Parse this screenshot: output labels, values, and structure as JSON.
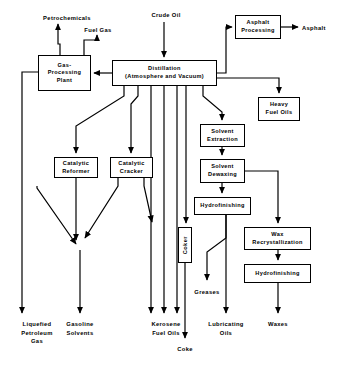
{
  "diagram": {
    "colors": {
      "line": "#000000",
      "box_fill": "#ffffff",
      "background": "#ffffff"
    },
    "process_boxes": [
      {
        "id": "gas-processing-plant",
        "label": "Gas-\nProcessing\nPlant",
        "x": 38,
        "y": 55,
        "w": 53,
        "h": 36
      },
      {
        "id": "distillation",
        "label": "Distillation\n(Atmosphere and Vacuum)",
        "x": 112,
        "y": 60,
        "w": 105,
        "h": 26
      },
      {
        "id": "asphalt-processing",
        "label": "Asphalt\nProcessing",
        "x": 235,
        "y": 15,
        "w": 46,
        "h": 24
      },
      {
        "id": "heavy-fuel-oils",
        "label": "Heavy\nFuel Oils",
        "x": 258,
        "y": 97,
        "w": 42,
        "h": 24
      },
      {
        "id": "catalytic-reformer",
        "label": "Catalytic\nReformer",
        "x": 54,
        "y": 157,
        "w": 44,
        "h": 21
      },
      {
        "id": "catalytic-cracker",
        "label": "Catalytic\nCracker",
        "x": 110,
        "y": 157,
        "w": 43,
        "h": 21
      },
      {
        "id": "solvent-extraction",
        "label": "Solvent\nExtraction",
        "x": 200,
        "y": 124,
        "w": 45,
        "h": 23
      },
      {
        "id": "solvent-dewaxing",
        "label": "Solvent\nDewaxing",
        "x": 200,
        "y": 159,
        "w": 45,
        "h": 24
      },
      {
        "id": "hydrofinishing-lube",
        "label": "Hydrofinishing",
        "x": 194,
        "y": 197,
        "w": 57,
        "h": 18
      },
      {
        "id": "wax-recrystallization",
        "label": "Wax\nRecrystallization",
        "x": 244,
        "y": 227,
        "w": 67,
        "h": 23
      },
      {
        "id": "hydrofinishing-wax",
        "label": "Hydrofinishing",
        "x": 244,
        "y": 264,
        "w": 67,
        "h": 19
      }
    ],
    "vertical_boxes": [
      {
        "id": "coker",
        "label": "Coker",
        "x": 178,
        "y": 227,
        "w": 14,
        "h": 36
      }
    ],
    "stream_labels": [
      {
        "id": "petrochemicals",
        "text": "Petrochemicals",
        "x": 31,
        "y": 14,
        "w": 72
      },
      {
        "id": "fuel-gas",
        "text": "Fuel Gas",
        "x": 74,
        "y": 26,
        "w": 48
      },
      {
        "id": "crude-oil",
        "text": "Crude Oil",
        "x": 140,
        "y": 11,
        "w": 52
      },
      {
        "id": "asphalt",
        "text": "Asphalt",
        "x": 302,
        "y": 24,
        "w": 40
      },
      {
        "id": "greases",
        "text": "Greases",
        "x": 186,
        "y": 288,
        "w": 42
      },
      {
        "id": "liquefied-petroleum-gas",
        "text": "Liquefied\nPetroleum\nGas",
        "x": 9,
        "y": 320,
        "w": 56
      },
      {
        "id": "gasoline-solvents",
        "text": "Gasoline\nSolvents",
        "x": 54,
        "y": 320,
        "w": 52
      },
      {
        "id": "kerosene-fuel-oils",
        "text": "Kerosene\nFuel Oils",
        "x": 140,
        "y": 320,
        "w": 52
      },
      {
        "id": "coke",
        "text": "Coke",
        "x": 167,
        "y": 345,
        "w": 36
      },
      {
        "id": "lubricating-oils",
        "text": "Lubricating\nOils",
        "x": 197,
        "y": 320,
        "w": 58
      },
      {
        "id": "waxes",
        "text": "Waxes",
        "x": 258,
        "y": 320,
        "w": 40
      }
    ],
    "connections": [
      {
        "from": "crude-oil",
        "to": "distillation"
      },
      {
        "from": "distillation",
        "to": "gas-processing-plant"
      },
      {
        "from": "gas-processing-plant",
        "to": "petrochemicals"
      },
      {
        "from": "gas-processing-plant",
        "to": "fuel-gas"
      },
      {
        "from": "gas-processing-plant",
        "to": "liquefied-petroleum-gas"
      },
      {
        "from": "gas-processing-plant",
        "to": "gasoline-solvents"
      },
      {
        "from": "distillation",
        "to": "asphalt-processing"
      },
      {
        "from": "asphalt-processing",
        "to": "asphalt"
      },
      {
        "from": "distillation",
        "to": "heavy-fuel-oils"
      },
      {
        "from": "distillation",
        "to": "catalytic-reformer"
      },
      {
        "from": "distillation",
        "to": "catalytic-cracker"
      },
      {
        "from": "distillation",
        "to": "kerosene-fuel-oils"
      },
      {
        "from": "distillation",
        "to": "coker"
      },
      {
        "from": "distillation",
        "to": "solvent-extraction"
      },
      {
        "from": "catalytic-reformer",
        "to": "gasoline-solvents"
      },
      {
        "from": "catalytic-cracker",
        "to": "gasoline-solvents"
      },
      {
        "from": "catalytic-cracker",
        "to": "kerosene-fuel-oils"
      },
      {
        "from": "coker",
        "to": "coke"
      },
      {
        "from": "solvent-extraction",
        "to": "solvent-dewaxing"
      },
      {
        "from": "solvent-dewaxing",
        "to": "hydrofinishing-lube"
      },
      {
        "from": "solvent-dewaxing",
        "to": "wax-recrystallization"
      },
      {
        "from": "hydrofinishing-lube",
        "to": "greases"
      },
      {
        "from": "hydrofinishing-lube",
        "to": "lubricating-oils"
      },
      {
        "from": "wax-recrystallization",
        "to": "hydrofinishing-wax"
      },
      {
        "from": "hydrofinishing-wax",
        "to": "waxes"
      }
    ]
  }
}
